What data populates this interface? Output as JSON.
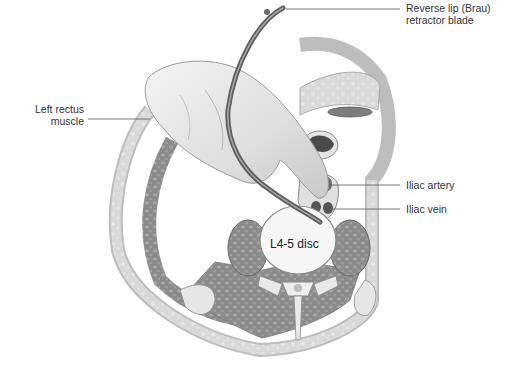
{
  "figure": {
    "type": "anatomical-illustration",
    "colors": {
      "background": "#ffffff",
      "muscle_dark": "#8a8a8a",
      "muscle_light": "#bdbdbd",
      "fat": "#dcdcdc",
      "bone": "#efefef",
      "skin_outline": "#9a9a9a",
      "hand": "#e6e6e6",
      "retractor": "#6e6e6e",
      "leader_line": "#555555",
      "label_text": "#333333"
    }
  },
  "labels": {
    "retractor_line1": "Reverse lip (Brau)",
    "retractor_line2": "retractor blade",
    "rectus_line1": "Left rectus",
    "rectus_line2": "muscle",
    "iliac_artery": "Iliac artery",
    "iliac_vein": "Iliac vein",
    "disc": "L4-5 disc"
  }
}
